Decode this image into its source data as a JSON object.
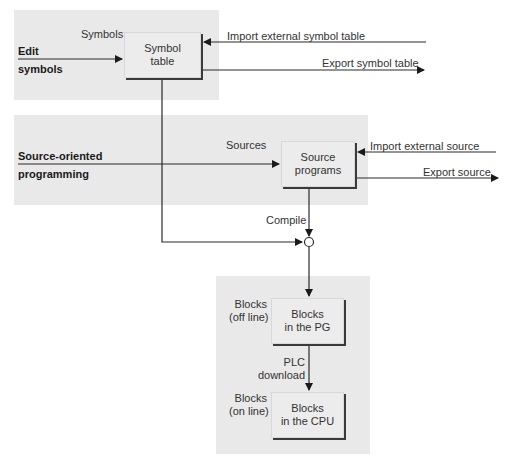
{
  "panels": {
    "symbols_panel": {
      "side_label": [
        "Edit",
        "symbols"
      ],
      "input_label": "Symbols",
      "box": [
        "Symbol",
        "table"
      ],
      "import_label": "Import external symbol table",
      "export_label": "Export symbol table"
    },
    "sources_panel": {
      "side_label": [
        "Source-oriented",
        "programming"
      ],
      "input_label": "Sources",
      "box": [
        "Source",
        "programs"
      ],
      "import_label": "Import external source",
      "export_label": "Export source"
    },
    "compile_label": "Compile",
    "blocks_panel": {
      "offline_label": [
        "Blocks",
        "(off line)"
      ],
      "offline_box": [
        "Blocks",
        "in the PG"
      ],
      "download_label": [
        "PLC",
        "download"
      ],
      "online_label": [
        "Blocks",
        "(on line)"
      ],
      "online_box": [
        "Blocks",
        "in the CPU"
      ]
    }
  },
  "colors": {
    "panel_bg": "#e9e9e9",
    "box_bg": "#ececec",
    "line": "#2a2a2a"
  }
}
